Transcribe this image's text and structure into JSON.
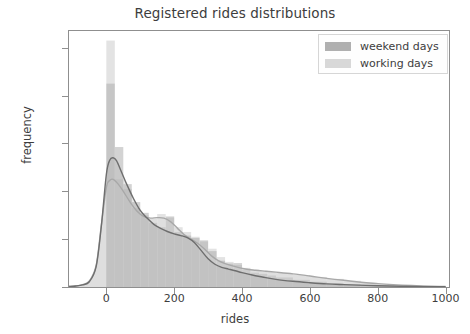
{
  "chart_data": {
    "type": "area",
    "title": "Registered rides distributions",
    "xlabel": "rides",
    "ylabel": "frequency",
    "xlim": [
      -110,
      1010
    ],
    "ylim": [
      0,
      0.0107
    ],
    "xticks": [
      0,
      200,
      400,
      600,
      800,
      1000
    ],
    "xticklabels": [
      "0",
      "200",
      "400",
      "600",
      "800",
      "1000"
    ],
    "yticks": [
      0.0,
      0.002,
      0.004,
      0.006,
      0.008,
      0.01
    ],
    "yticklabels": [
      "0.000",
      "0.002",
      "0.004",
      "0.006",
      "0.008",
      "0.010"
    ],
    "grid": false,
    "legend_position": "upper right",
    "series": [
      {
        "name": "weekend days",
        "color": "#b0b0b0",
        "line_color": "#6e6e6e",
        "kde_x": [
          -110,
          -90,
          -70,
          -50,
          -30,
          -15,
          0,
          10,
          20,
          30,
          45,
          60,
          80,
          100,
          120,
          140,
          160,
          180,
          200,
          220,
          240,
          260,
          280,
          300,
          320,
          340,
          360,
          380,
          400,
          430,
          460,
          500,
          550,
          600,
          650,
          700,
          800,
          900,
          1000
        ],
        "kde_y": [
          2e-05,
          4e-05,
          9e-05,
          0.00022,
          0.00085,
          0.0025,
          0.0047,
          0.0053,
          0.0054,
          0.00528,
          0.0048,
          0.0043,
          0.0037,
          0.0032,
          0.00288,
          0.00262,
          0.00245,
          0.00232,
          0.00222,
          0.00215,
          0.00205,
          0.00185,
          0.00152,
          0.00118,
          0.00095,
          0.00082,
          0.00075,
          0.00068,
          0.0006,
          0.0005,
          0.00042,
          0.00032,
          0.00024,
          0.00018,
          0.00013,
          0.0001,
          5e-05,
          2e-05,
          1e-05
        ],
        "hist_bins": [
          0,
          25,
          50,
          75,
          100,
          125,
          150,
          175,
          200,
          225,
          250,
          275,
          300,
          325,
          350,
          375,
          400,
          425,
          450,
          475,
          500,
          550,
          600,
          650,
          700,
          750,
          800,
          850,
          900,
          950
        ],
        "hist_values": [
          0.0085,
          0.00585,
          0.0043,
          0.00355,
          0.0031,
          0.00268,
          0.0025,
          0.00295,
          0.0023,
          0.00215,
          0.00205,
          0.00195,
          0.0015,
          0.0011,
          0.00098,
          0.001,
          0.00072,
          0.0006,
          0.00055,
          0.00048,
          0.0004,
          0.0003,
          0.00022,
          0.00016,
          0.00012,
          9e-05,
          6e-05,
          4e-05,
          2e-05,
          1e-05
        ]
      },
      {
        "name": "working days",
        "color": "#d8d8d8",
        "line_color": "#a8a8a8",
        "kde_x": [
          -110,
          -90,
          -70,
          -50,
          -30,
          -15,
          0,
          10,
          20,
          35,
          50,
          70,
          90,
          110,
          130,
          150,
          170,
          190,
          210,
          230,
          250,
          270,
          290,
          310,
          330,
          350,
          380,
          410,
          440,
          470,
          500,
          550,
          600,
          650,
          700,
          800,
          900,
          1000
        ],
        "kde_y": [
          2e-05,
          4e-05,
          0.0001,
          0.00025,
          0.0009,
          0.00255,
          0.00415,
          0.00445,
          0.0045,
          0.0043,
          0.004,
          0.00355,
          0.00318,
          0.00295,
          0.00288,
          0.0029,
          0.00288,
          0.00272,
          0.00245,
          0.00218,
          0.002,
          0.00182,
          0.00158,
          0.0013,
          0.0011,
          0.00098,
          0.00085,
          0.00075,
          0.0007,
          0.00066,
          0.00062,
          0.00055,
          0.00046,
          0.00036,
          0.00028,
          0.00014,
          6e-05,
          2e-05
        ],
        "hist_bins": [
          0,
          25,
          50,
          75,
          100,
          125,
          150,
          175,
          200,
          225,
          250,
          275,
          300,
          325,
          350,
          375,
          400,
          425,
          450,
          475,
          500,
          550,
          600,
          650,
          700,
          750,
          800,
          850,
          900,
          950
        ],
        "hist_values": [
          0.0103,
          0.0045,
          0.0041,
          0.0033,
          0.003,
          0.00285,
          0.00305,
          0.0029,
          0.0025,
          0.0023,
          0.0021,
          0.0019,
          0.0016,
          0.00125,
          0.00105,
          0.00092,
          0.0008,
          0.00072,
          0.00068,
          0.00062,
          0.00058,
          0.0005,
          0.00042,
          0.00034,
          0.00026,
          0.00018,
          0.00012,
          8e-05,
          4e-05,
          2e-05
        ]
      }
    ]
  },
  "legend": {
    "entries": [
      {
        "label": "weekend days"
      },
      {
        "label": "working days"
      }
    ]
  }
}
